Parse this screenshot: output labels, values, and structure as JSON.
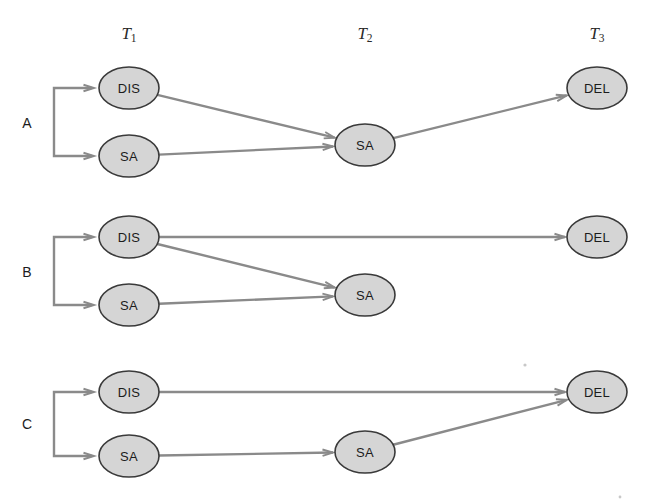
{
  "figure": {
    "title": "",
    "type": "state-transition-diagram",
    "background_color": "#ffffff",
    "node_fill_color": "#d5d5d5",
    "node_stroke_color": "#3a3a3a",
    "edge_color": "#8a8a8a",
    "text_color": "#1c1c1c"
  },
  "columns": [
    {
      "id": "T1",
      "base": "T",
      "subscript": "1",
      "label": "T1",
      "x": 129
    },
    {
      "id": "T2",
      "base": "T",
      "subscript": "2",
      "label": "T2",
      "x": 365
    },
    {
      "id": "T3",
      "base": "T",
      "subscript": "3",
      "label": "T3",
      "x": 597
    }
  ],
  "column_header_y": 33,
  "rows": [
    {
      "id": "A",
      "label": "A",
      "label_x": 27,
      "label_y": 123,
      "bracket": {
        "x": 54,
        "y_top": 88,
        "y_bottom": 156,
        "arm_end_x": 92
      },
      "nodes": [
        {
          "id": "A-T1-DIS",
          "label": "DIS",
          "column": "T1",
          "cx": 129,
          "cy": 88,
          "rx": 30,
          "ry": 21
        },
        {
          "id": "A-T1-SA",
          "label": "SA",
          "column": "T1",
          "cx": 129,
          "cy": 156,
          "rx": 30,
          "ry": 21
        },
        {
          "id": "A-T2-SA",
          "label": "SA",
          "column": "T2",
          "cx": 365,
          "cy": 145,
          "rx": 30,
          "ry": 21
        },
        {
          "id": "A-T3-DEL",
          "label": "DEL",
          "column": "T3",
          "cx": 597,
          "cy": 88,
          "rx": 30,
          "ry": 21
        }
      ],
      "edges": [
        {
          "from": "A-T1-DIS",
          "to": "A-T2-SA"
        },
        {
          "from": "A-T1-SA",
          "to": "A-T2-SA"
        },
        {
          "from": "A-T2-SA",
          "to": "A-T3-DEL"
        }
      ]
    },
    {
      "id": "B",
      "label": "B",
      "label_x": 27,
      "label_y": 272,
      "bracket": {
        "x": 54,
        "y_top": 237,
        "y_bottom": 305,
        "arm_end_x": 92
      },
      "nodes": [
        {
          "id": "B-T1-DIS",
          "label": "DIS",
          "column": "T1",
          "cx": 129,
          "cy": 237,
          "rx": 30,
          "ry": 21
        },
        {
          "id": "B-T1-SA",
          "label": "SA",
          "column": "T1",
          "cx": 129,
          "cy": 305,
          "rx": 30,
          "ry": 21
        },
        {
          "id": "B-T2-SA",
          "label": "SA",
          "column": "T2",
          "cx": 365,
          "cy": 295,
          "rx": 30,
          "ry": 21
        },
        {
          "id": "B-T3-DEL",
          "label": "DEL",
          "column": "T3",
          "cx": 597,
          "cy": 237,
          "rx": 30,
          "ry": 21
        }
      ],
      "edges": [
        {
          "from": "B-T1-DIS",
          "to": "B-T3-DEL"
        },
        {
          "from": "B-T1-DIS",
          "to": "B-T2-SA"
        },
        {
          "from": "B-T1-SA",
          "to": "B-T2-SA"
        }
      ]
    },
    {
      "id": "C",
      "label": "C",
      "label_x": 27,
      "label_y": 424,
      "bracket": {
        "x": 54,
        "y_top": 392,
        "y_bottom": 456,
        "arm_end_x": 92
      },
      "nodes": [
        {
          "id": "C-T1-DIS",
          "label": "DIS",
          "column": "T1",
          "cx": 129,
          "cy": 392,
          "rx": 30,
          "ry": 21
        },
        {
          "id": "C-T1-SA",
          "label": "SA",
          "column": "T1",
          "cx": 129,
          "cy": 456,
          "rx": 30,
          "ry": 21
        },
        {
          "id": "C-T2-SA",
          "label": "SA",
          "column": "T2",
          "cx": 365,
          "cy": 452,
          "rx": 30,
          "ry": 21
        },
        {
          "id": "C-T3-DEL",
          "label": "DEL",
          "column": "T3",
          "cx": 597,
          "cy": 392,
          "rx": 30,
          "ry": 21
        }
      ],
      "edges": [
        {
          "from": "C-T1-DIS",
          "to": "C-T3-DEL"
        },
        {
          "from": "C-T1-SA",
          "to": "C-T2-SA"
        },
        {
          "from": "C-T2-SA",
          "to": "C-T3-DEL"
        }
      ]
    }
  ],
  "node_labels": {
    "DIS": "DIS",
    "SA": "SA",
    "DEL": "DEL"
  }
}
